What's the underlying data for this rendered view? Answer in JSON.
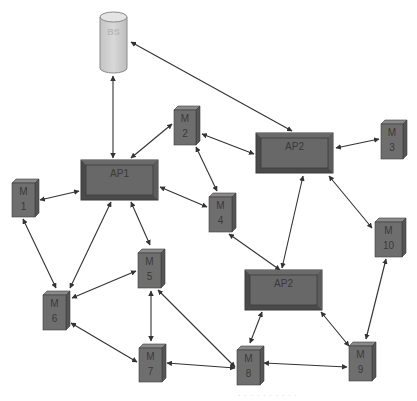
{
  "diagram": {
    "type": "network-topology",
    "colors": {
      "background": "#ffffff",
      "node_fill": "#6e6e6e",
      "node_side": "#555555",
      "node_top": "#8a8a8a",
      "ap_outer": "#5a5a5a",
      "ap_inner": "#686868",
      "bs_fill": "#cfcfcf",
      "bs_top": "#e4e4e4",
      "edge": "#333333",
      "label": "#3a3a3a"
    },
    "nodes": [
      {
        "id": "BS",
        "kind": "base-station",
        "label": "BS",
        "x": 100,
        "y": 12,
        "w": 27,
        "h": 61
      },
      {
        "id": "AP1",
        "kind": "access-point",
        "label": "AP1",
        "x": 81,
        "y": 160,
        "w": 77,
        "h": 40
      },
      {
        "id": "AP2a",
        "kind": "access-point",
        "label": "AP2",
        "x": 256,
        "y": 133,
        "w": 77,
        "h": 40
      },
      {
        "id": "AP2b",
        "kind": "access-point",
        "label": "AP2",
        "x": 245,
        "y": 270,
        "w": 77,
        "h": 40
      },
      {
        "id": "M1",
        "kind": "mobile",
        "label_top": "M",
        "label_bottom": "1",
        "x": 12,
        "y": 179,
        "w": 23,
        "h": 38
      },
      {
        "id": "M2",
        "kind": "mobile",
        "label_top": "M",
        "label_bottom": "2",
        "x": 174,
        "y": 106,
        "w": 22,
        "h": 39
      },
      {
        "id": "M3",
        "kind": "mobile",
        "label_top": "M",
        "label_bottom": "3",
        "x": 381,
        "y": 120,
        "w": 22,
        "h": 39
      },
      {
        "id": "M4",
        "kind": "mobile",
        "label_top": "M",
        "label_bottom": "4",
        "x": 209,
        "y": 193,
        "w": 23,
        "h": 39
      },
      {
        "id": "M5",
        "kind": "mobile",
        "label_top": "M",
        "label_bottom": "5",
        "x": 138,
        "y": 249,
        "w": 23,
        "h": 39
      },
      {
        "id": "M6",
        "kind": "mobile",
        "label_top": "M",
        "label_bottom": "6",
        "x": 43,
        "y": 291,
        "w": 23,
        "h": 39
      },
      {
        "id": "M7",
        "kind": "mobile",
        "label_top": "M",
        "label_bottom": "7",
        "x": 139,
        "y": 344,
        "w": 23,
        "h": 38
      },
      {
        "id": "M8",
        "kind": "mobile",
        "label_top": "M",
        "label_bottom": "8",
        "x": 237,
        "y": 346,
        "w": 23,
        "h": 39
      },
      {
        "id": "M9",
        "kind": "mobile",
        "label_top": "M",
        "label_bottom": "9",
        "x": 349,
        "y": 342,
        "w": 23,
        "h": 39
      },
      {
        "id": "M10",
        "kind": "mobile",
        "label_top": "M",
        "label_bottom": "10",
        "x": 375,
        "y": 218,
        "w": 27,
        "h": 39
      }
    ],
    "edges": [
      {
        "from": "BS",
        "to": "AP1",
        "x1": 113,
        "y1": 76,
        "x2": 113,
        "y2": 158
      },
      {
        "from": "BS",
        "to": "AP2a",
        "x1": 131,
        "y1": 42,
        "x2": 292,
        "y2": 131
      },
      {
        "from": "AP1",
        "to": "M2",
        "x1": 131,
        "y1": 158,
        "x2": 172,
        "y2": 124
      },
      {
        "from": "M2",
        "to": "AP2a",
        "x1": 202,
        "y1": 134,
        "x2": 254,
        "y2": 154
      },
      {
        "from": "M2",
        "to": "M4",
        "x1": 196,
        "y1": 147,
        "x2": 217,
        "y2": 191
      },
      {
        "from": "AP2a",
        "to": "M3",
        "x1": 336,
        "y1": 148,
        "x2": 379,
        "y2": 139
      },
      {
        "from": "AP1",
        "to": "M4",
        "x1": 160,
        "y1": 187,
        "x2": 207,
        "y2": 207
      },
      {
        "from": "M1",
        "to": "AP1",
        "x1": 40,
        "y1": 200,
        "x2": 79,
        "y2": 191
      },
      {
        "from": "M1",
        "to": "M6",
        "x1": 23,
        "y1": 219,
        "x2": 56,
        "y2": 288
      },
      {
        "from": "AP1",
        "to": "M6",
        "x1": 111,
        "y1": 202,
        "x2": 70,
        "y2": 288
      },
      {
        "from": "AP1",
        "to": "M5",
        "x1": 131,
        "y1": 202,
        "x2": 150,
        "y2": 245
      },
      {
        "from": "M5",
        "to": "M6",
        "x1": 136,
        "y1": 271,
        "x2": 72,
        "y2": 298
      },
      {
        "from": "M5",
        "to": "M7",
        "x1": 151,
        "y1": 291,
        "x2": 151,
        "y2": 341
      },
      {
        "from": "M5",
        "to": "M8",
        "x1": 158,
        "y1": 290,
        "x2": 235,
        "y2": 367
      },
      {
        "from": "M6",
        "to": "M7",
        "x1": 71,
        "y1": 323,
        "x2": 137,
        "y2": 362
      },
      {
        "from": "M7",
        "to": "M8",
        "x1": 167,
        "y1": 363,
        "x2": 235,
        "y2": 368
      },
      {
        "from": "M4",
        "to": "AP2b",
        "x1": 229,
        "y1": 234,
        "x2": 280,
        "y2": 270
      },
      {
        "from": "AP2a",
        "to": "AP2b",
        "x1": 303,
        "y1": 176,
        "x2": 282,
        "y2": 268
      },
      {
        "from": "AP2a",
        "to": "M10",
        "x1": 329,
        "y1": 176,
        "x2": 372,
        "y2": 228
      },
      {
        "from": "AP2b",
        "to": "M8",
        "x1": 262,
        "y1": 312,
        "x2": 250,
        "y2": 343
      },
      {
        "from": "AP2b",
        "to": "M9",
        "x1": 321,
        "y1": 312,
        "x2": 349,
        "y2": 346
      },
      {
        "from": "M10",
        "to": "M9",
        "x1": 386,
        "y1": 259,
        "x2": 366,
        "y2": 339
      },
      {
        "from": "M8",
        "to": "M9",
        "x1": 264,
        "y1": 363,
        "x2": 347,
        "y2": 367
      }
    ],
    "caption": "· · ·  · · · · · · ·"
  }
}
